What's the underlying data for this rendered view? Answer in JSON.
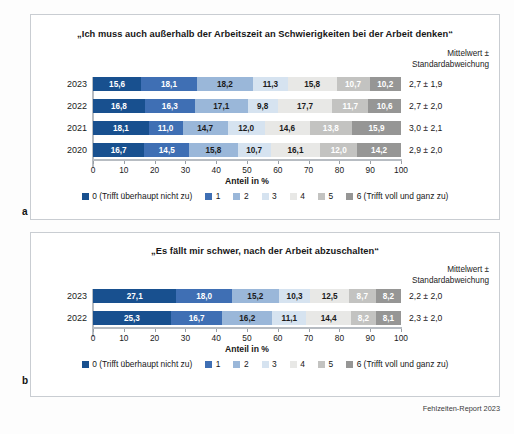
{
  "source_note": "Fehlzeiten-Report 2023",
  "panels": [
    {
      "letter": "a",
      "title": "„Ich muss auch außerhalb der Arbeitszeit an Schwierigkeiten bei der Arbeit denken“",
      "mean_header": "Mittelwert ±\nStandardabweichung",
      "axis_label": "Anteil in %",
      "tick_labels": [
        "0",
        "10",
        "20",
        "30",
        "40",
        "50",
        "60",
        "70",
        "80",
        "90",
        "100"
      ],
      "rows": [
        {
          "label": "2023",
          "values": [
            15.6,
            18.1,
            18.2,
            11.3,
            15.8,
            10.7,
            10.2
          ],
          "value_labels": [
            "15,6",
            "18,1",
            "18,2",
            "11,3",
            "15,8",
            "10,7",
            "10,2"
          ],
          "mean": "2,7 ± 1,9"
        },
        {
          "label": "2022",
          "values": [
            16.8,
            16.3,
            17.1,
            9.8,
            17.7,
            11.7,
            10.6
          ],
          "value_labels": [
            "16,8",
            "16,3",
            "17,1",
            "9,8",
            "17,7",
            "11,7",
            "10,6"
          ],
          "mean": "2,7 ± 2,0"
        },
        {
          "label": "2021",
          "values": [
            18.1,
            11.0,
            14.7,
            12.0,
            14.6,
            13.8,
            15.9
          ],
          "value_labels": [
            "18,1",
            "11,0",
            "14,7",
            "12,0",
            "14,6",
            "13,8",
            "15,9"
          ],
          "mean": "3,0 ± 2,1"
        },
        {
          "label": "2020",
          "values": [
            16.7,
            14.5,
            15.8,
            10.7,
            16.1,
            12.0,
            14.2
          ],
          "value_labels": [
            "16,7",
            "14,5",
            "15,8",
            "10,7",
            "16,1",
            "12,0",
            "14,2"
          ],
          "mean": "2,9 ± 2,0"
        }
      ],
      "legend": [
        "0 (Trifft überhaupt nicht zu)",
        "1",
        "2",
        "3",
        "4",
        "5",
        "6 (Trifft voll und ganz zu)"
      ]
    },
    {
      "letter": "b",
      "title": "„Es fällt mir schwer, nach der Arbeit abzuschalten“",
      "mean_header": "Mittelwert ±\nStandardabweichung",
      "axis_label": "Anteil in %",
      "tick_labels": [
        "0",
        "10",
        "20",
        "30",
        "40",
        "50",
        "60",
        "70",
        "80",
        "90",
        "100"
      ],
      "rows": [
        {
          "label": "2023",
          "values": [
            27.1,
            18.0,
            15.2,
            10.3,
            12.5,
            8.7,
            8.2
          ],
          "value_labels": [
            "27,1",
            "18,0",
            "15,2",
            "10,3",
            "12,5",
            "8,7",
            "8,2"
          ],
          "mean": "2,2 ± 2,0"
        },
        {
          "label": "2022",
          "values": [
            25.3,
            16.7,
            16.2,
            11.1,
            14.4,
            8.2,
            8.1
          ],
          "value_labels": [
            "25,3",
            "16,7",
            "16,2",
            "11,1",
            "14,4",
            "8,2",
            "8,1"
          ],
          "mean": "2,3 ± 2,0"
        }
      ],
      "legend": [
        "0 (Trifft überhaupt nicht zu)",
        "1",
        "2",
        "3",
        "4",
        "5",
        "6 (Trifft voll und ganz zu)"
      ]
    }
  ],
  "palette": {
    "c0": "#18508f",
    "c1": "#3f6fb4",
    "c2": "#9ab7d9",
    "c3": "#d6e3f0",
    "c4": "#e8e8e6",
    "c5": "#c3c3c1",
    "c6": "#969695"
  },
  "label_text_colors": [
    "#ffffff",
    "#ffffff",
    "#1b1b1b",
    "#1b1b1b",
    "#1b1b1b",
    "#ffffff",
    "#ffffff"
  ],
  "chart_data": [
    {
      "type": "bar",
      "orientation": "horizontal",
      "stacked": true,
      "normalized_percent": true,
      "title": "„Ich muss auch außerhalb der Arbeitszeit an Schwierigkeiten bei der Arbeit denken“",
      "xlabel": "Anteil in %",
      "ylabel": "",
      "xlim": [
        0,
        100
      ],
      "grid": false,
      "legend_position": "bottom",
      "categories": [
        "2023",
        "2022",
        "2021",
        "2020"
      ],
      "series": [
        {
          "name": "0 (Trifft überhaupt nicht zu)",
          "values": [
            15.6,
            16.8,
            18.1,
            16.7
          ]
        },
        {
          "name": "1",
          "values": [
            18.1,
            16.3,
            11.0,
            14.5
          ]
        },
        {
          "name": "2",
          "values": [
            18.2,
            17.1,
            14.7,
            15.8
          ]
        },
        {
          "name": "3",
          "values": [
            11.3,
            9.8,
            12.0,
            10.7
          ]
        },
        {
          "name": "4",
          "values": [
            15.8,
            17.7,
            14.6,
            16.1
          ]
        },
        {
          "name": "5",
          "values": [
            10.7,
            11.7,
            13.8,
            12.0
          ]
        },
        {
          "name": "6 (Trifft voll und ganz zu)",
          "values": [
            10.2,
            10.6,
            15.9,
            14.2
          ]
        }
      ],
      "annotations": {
        "header": "Mittelwert ± Standardabweichung",
        "2023": "2,7 ± 1,9",
        "2022": "2,7 ± 2,0",
        "2021": "3,0 ± 2,1",
        "2020": "2,9 ± 2,0"
      }
    },
    {
      "type": "bar",
      "orientation": "horizontal",
      "stacked": true,
      "normalized_percent": true,
      "title": "„Es fällt mir schwer, nach der Arbeit abzuschalten“",
      "xlabel": "Anteil in %",
      "ylabel": "",
      "xlim": [
        0,
        100
      ],
      "grid": false,
      "legend_position": "bottom",
      "categories": [
        "2023",
        "2022"
      ],
      "series": [
        {
          "name": "0 (Trifft überhaupt nicht zu)",
          "values": [
            27.1,
            25.3
          ]
        },
        {
          "name": "1",
          "values": [
            18.0,
            16.7
          ]
        },
        {
          "name": "2",
          "values": [
            15.2,
            16.2
          ]
        },
        {
          "name": "3",
          "values": [
            10.3,
            11.1
          ]
        },
        {
          "name": "4",
          "values": [
            12.5,
            14.4
          ]
        },
        {
          "name": "5",
          "values": [
            8.7,
            8.2
          ]
        },
        {
          "name": "6 (Trifft voll und ganz zu)",
          "values": [
            8.2,
            8.1
          ]
        }
      ],
      "annotations": {
        "header": "Mittelwert ± Standardabweichung",
        "2023": "2,2 ± 2,0",
        "2022": "2,3 ± 2,0"
      }
    }
  ]
}
